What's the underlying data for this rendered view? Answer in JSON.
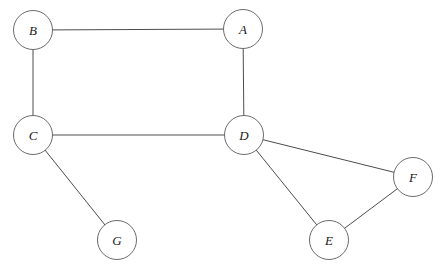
{
  "diagram": {
    "kind": "undirected-graph",
    "title": "",
    "background_color": "#ffffff",
    "node_fill_color": "#ffffff",
    "node_stroke_color": "#5a5a5a",
    "edge_color": "#4d4d4d",
    "label_color": "#1a1a1a",
    "node_radius": 19.5,
    "nodes": [
      {
        "id": "A",
        "label": "A",
        "cx": 243,
        "cy": 29,
        "r": 19.5
      },
      {
        "id": "B",
        "label": "B",
        "cx": 33,
        "cy": 30,
        "r": 19.5
      },
      {
        "id": "C",
        "label": "C",
        "cx": 33,
        "cy": 135,
        "r": 19.5
      },
      {
        "id": "D",
        "label": "D",
        "cx": 244,
        "cy": 135,
        "r": 19.5
      },
      {
        "id": "E",
        "label": "E",
        "cx": 329,
        "cy": 240,
        "r": 19.5
      },
      {
        "id": "F",
        "label": "F",
        "cx": 413,
        "cy": 177,
        "r": 19.5
      },
      {
        "id": "G",
        "label": "G",
        "cx": 117,
        "cy": 240,
        "r": 19.5
      }
    ],
    "edges": [
      {
        "id": "B-A",
        "source": "B",
        "target": "A",
        "label": ""
      },
      {
        "id": "B-C",
        "source": "B",
        "target": "C",
        "label": ""
      },
      {
        "id": "A-D",
        "source": "A",
        "target": "D",
        "label": ""
      },
      {
        "id": "C-D",
        "source": "C",
        "target": "D",
        "label": ""
      },
      {
        "id": "C-G",
        "source": "C",
        "target": "G",
        "label": ""
      },
      {
        "id": "D-F",
        "source": "D",
        "target": "F",
        "label": ""
      },
      {
        "id": "D-E",
        "source": "D",
        "target": "E",
        "label": ""
      },
      {
        "id": "E-F",
        "source": "E",
        "target": "F",
        "label": ""
      }
    ]
  }
}
